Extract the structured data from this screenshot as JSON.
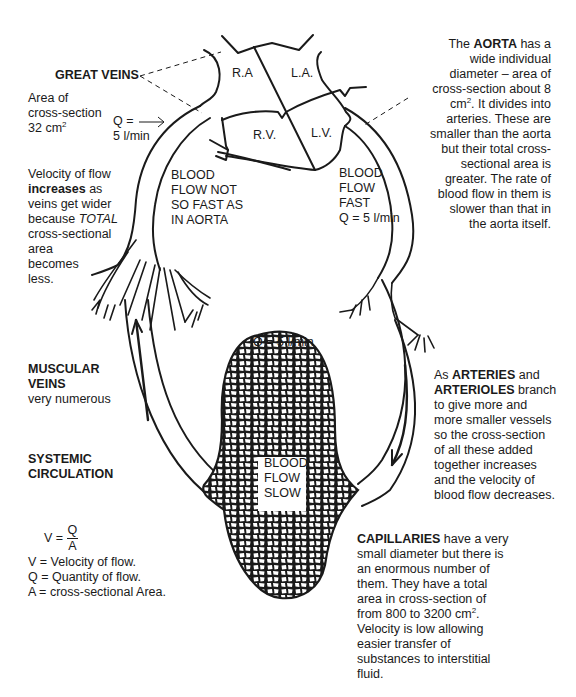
{
  "heart": {
    "chambers": {
      "ra": "R.A",
      "la": "L.A.",
      "rv": "R.V.",
      "lv": "L.V."
    }
  },
  "great_veins": {
    "title": "GREAT VEINS",
    "area_lines": [
      "Area of",
      "cross-section"
    ],
    "area_value": "32 cm",
    "area_exp": "2"
  },
  "inflow": {
    "q_line1": "Q =",
    "q_line2": "5 l/min"
  },
  "vein_velocity": {
    "line1": "Velocity of flow",
    "line2_bold": "increases",
    "line2_rest": " as",
    "line3": "veins get wider",
    "line4_pre": "because ",
    "line4_italic": "TOTAL",
    "line5": "cross-sectional",
    "line6": "area",
    "line7": "becomes",
    "line8": "less."
  },
  "vein_flow": {
    "lines": [
      "BLOOD",
      "FLOW NOT",
      "SO FAST AS",
      "IN AORTA"
    ]
  },
  "aorta_flow": {
    "lines": [
      "BLOOD",
      "FLOW",
      "FAST",
      "Q = 5 l/min"
    ]
  },
  "aorta_note": {
    "line1_pre": "The ",
    "line1_bold": "AORTA",
    "line1_post": " has a",
    "line2": "wide individual",
    "line3": "diameter – area of",
    "line4": "cross-section about 8",
    "line5_pre": "cm",
    "line5_exp": "2",
    "line5_post": ". It divides into",
    "line6": "arteries. These are",
    "line7": "smaller than the aorta",
    "line8": "but their total cross-",
    "line9": "sectional area is",
    "line10": "greater. The rate of",
    "line11": "blood flow in them is",
    "line12": "slower than that in",
    "line13": "the aorta itself."
  },
  "capillary_q": "Q = 5 l/min",
  "capillary_flow": {
    "lines": [
      "BLOOD",
      "FLOW",
      "SLOW"
    ]
  },
  "muscular_veins": {
    "title_lines": [
      "MUSCULAR",
      "VEINS"
    ],
    "sub": "very numerous"
  },
  "systemic": {
    "lines": [
      "SYSTEMIC",
      "CIRCULATION"
    ]
  },
  "formula": {
    "lhs": "V =",
    "num": "Q",
    "den": "A",
    "defs": [
      "V = Velocity of flow.",
      "Q = Quantity of flow.",
      "A = cross-sectional Area."
    ]
  },
  "arteries_note": {
    "line1_pre": "As ",
    "line1_bold": "ARTERIES",
    "line1_post": " and",
    "line2_bold": "ARTERIOLES",
    "line2_post": " branch",
    "line3": "to give more and",
    "line4": "more smaller vessels",
    "line5": "so the cross-section",
    "line6": "of all these added",
    "line7": "together increases",
    "line8": "and the velocity of",
    "line9": "blood flow decreases."
  },
  "capillaries_note": {
    "line1_bold": "CAPILLARIES",
    "line1_post": " have a very",
    "line2": "small diameter but there is",
    "line3": "an enormous number of",
    "line4": "them. They have a total",
    "line5": "area in cross-section of",
    "line6_pre": "from 800 to 3200 cm",
    "line6_exp": "2",
    "line6_post": ".",
    "line7": "Velocity is low allowing",
    "line8": "easier transfer of",
    "line9": "substances to interstitial",
    "line10": "fluid."
  },
  "colors": {
    "ink": "#1a1a1a",
    "background": "#ffffff"
  }
}
